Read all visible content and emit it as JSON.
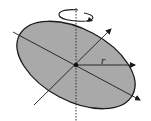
{
  "diagram": {
    "labels": {
      "radius": "r"
    },
    "colors": {
      "disk_fill": "#a9a9a9",
      "stroke": "#1a1a1a",
      "background": "#ffffff"
    },
    "elements": [
      "disk",
      "rotation-axis",
      "rotation-arrow",
      "long-axis-arrow",
      "perpendicular-axis-arrow",
      "radius-arrow",
      "center-point"
    ]
  }
}
